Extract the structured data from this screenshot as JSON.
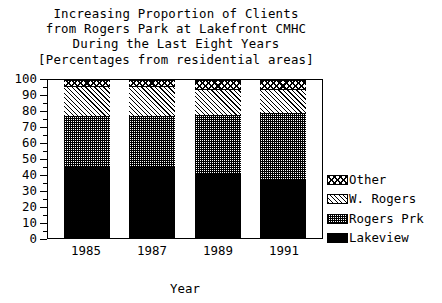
{
  "chart_data": {
    "type": "bar",
    "subtype": "stacked-bar-percentage",
    "title": "Increasing Proportion of Clients from Rogers Park at Lakefront CMHC During the Last Eight Years [Percentages from residential areas]",
    "title_lines": [
      "Increasing Proportion of Clients",
      "from Rogers Park at Lakefront CMHC",
      "During the Last Eight Years",
      "[Percentages from residential areas]"
    ],
    "xlabel": "Year",
    "ylabel": "",
    "categories": [
      "1985",
      "1987",
      "1989",
      "1991"
    ],
    "ylim": [
      0,
      100
    ],
    "ytick_labels": [
      "0",
      "10",
      "20",
      "30",
      "40",
      "50",
      "60",
      "70",
      "80",
      "90",
      "100"
    ],
    "ytick_values": [
      0,
      10,
      20,
      30,
      40,
      50,
      60,
      70,
      80,
      90,
      100
    ],
    "ytick_minor_step": 5,
    "grid": false,
    "legend_position": "right",
    "stack_order_bottom_to_top": [
      "Lakeview",
      "Rogers Prk",
      "W. Rogers",
      "Other"
    ],
    "series": [
      {
        "name": "Lakeview",
        "pattern": "solid-black",
        "values": [
          45,
          45,
          41,
          37
        ]
      },
      {
        "name": "Rogers Prk",
        "pattern": "fine-checker",
        "values": [
          32,
          32,
          37,
          42
        ]
      },
      {
        "name": "W. Rogers",
        "pattern": "diagonal-hatch",
        "values": [
          19,
          19,
          16,
          15
        ]
      },
      {
        "name": "Other",
        "pattern": "crosshatch",
        "values": [
          4,
          4,
          6,
          6
        ]
      }
    ],
    "cumulative_tops": {
      "1985": {
        "Lakeview": 45,
        "Rogers Prk": 77,
        "W. Rogers": 96,
        "Other": 100
      },
      "1987": {
        "Lakeview": 45,
        "Rogers Prk": 77,
        "W. Rogers": 96,
        "Other": 100
      },
      "1989": {
        "Lakeview": 41,
        "Rogers Prk": 78,
        "W. Rogers": 94,
        "Other": 100
      },
      "1991": {
        "Lakeview": 37,
        "Rogers Prk": 79,
        "W. Rogers": 94,
        "Other": 100
      }
    }
  },
  "legend": {
    "items": [
      {
        "label": "Other",
        "pattern": "crosshatch"
      },
      {
        "label": "W. Rogers",
        "pattern": "diagonal-hatch"
      },
      {
        "label": "Rogers Prk",
        "pattern": "fine-checker"
      },
      {
        "label": "Lakeview",
        "pattern": "solid-black"
      }
    ]
  },
  "colors": {
    "ink": "#000000",
    "background": "#ffffff"
  }
}
